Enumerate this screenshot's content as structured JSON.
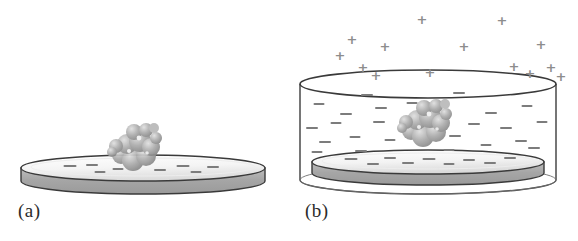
{
  "figure": {
    "width": 578,
    "height": 241,
    "background": "#ffffff"
  },
  "colors": {
    "outline": "#3a3a3a",
    "disk_side": "#a8a8a8",
    "disk_side_dark": "#8f8f8f",
    "disk_top": "#f2f2f2",
    "disk_top_shade": "#d8d8d8",
    "molecule": "#a3a3a3",
    "molecule_dark": "#8a8a8a",
    "molecule_light": "#d5d5d5",
    "ion_positive": "#8d8d8d",
    "ion_negative": "#7c7c7c",
    "label_text": "#2b2b2b",
    "beaker_glass": "#4a4a4a"
  },
  "panels": [
    {
      "id": "a",
      "label": "(a)",
      "caption_text": "(a)",
      "description": "Charged disk substrate in air with a single molecule adsorbed on its upper surface",
      "has_beaker": false,
      "has_positive_ions": false,
      "disk": {
        "center_x": 143,
        "top_center_y": 168,
        "radius_x": 122,
        "radius_y": 13,
        "thickness": 26
      },
      "molecule": {
        "center_x": 133,
        "center_y": 148,
        "scale": 1.0
      },
      "surface_charges": [
        {
          "x": 70,
          "y": 166,
          "w": 13
        },
        {
          "x": 92,
          "y": 165,
          "w": 12
        },
        {
          "x": 100,
          "y": 172,
          "w": 11
        },
        {
          "x": 118,
          "y": 169,
          "w": 11
        },
        {
          "x": 160,
          "y": 170,
          "w": 12
        },
        {
          "x": 183,
          "y": 166,
          "w": 13
        },
        {
          "x": 196,
          "y": 172,
          "w": 11
        },
        {
          "x": 213,
          "y": 167,
          "w": 12
        }
      ]
    },
    {
      "id": "b",
      "label": "(b)",
      "caption_text": "(b)",
      "description": "Same substrate immersed in an electrolyte-filled beaker; positive counter-ions above, negative charges dispersed in the solution",
      "has_beaker": true,
      "has_positive_ions": true,
      "beaker": {
        "center_x": 139,
        "rim_y": 84,
        "radius_x": 128,
        "radius_y": 14,
        "height": 96
      },
      "disk": {
        "center_x": 139,
        "top_center_y": 162,
        "radius_x": 116,
        "radius_y": 12,
        "thickness": 22
      },
      "molecule": {
        "center_x": 134,
        "center_y": 124,
        "scale": 1.05
      },
      "positive_ions": [
        {
          "x": 51,
          "y": 55
        },
        {
          "x": 63,
          "y": 39
        },
        {
          "x": 74,
          "y": 67
        },
        {
          "x": 87,
          "y": 75
        },
        {
          "x": 96,
          "y": 46
        },
        {
          "x": 133,
          "y": 19
        },
        {
          "x": 141,
          "y": 72
        },
        {
          "x": 175,
          "y": 46
        },
        {
          "x": 213,
          "y": 20
        },
        {
          "x": 225,
          "y": 66
        },
        {
          "x": 241,
          "y": 73
        },
        {
          "x": 252,
          "y": 44
        },
        {
          "x": 262,
          "y": 67
        },
        {
          "x": 272,
          "y": 76
        }
      ],
      "negative_ions": [
        {
          "x": 78,
          "y": 95,
          "w": 12
        },
        {
          "x": 170,
          "y": 93,
          "w": 12
        },
        {
          "x": 30,
          "y": 104,
          "w": 11
        },
        {
          "x": 57,
          "y": 114,
          "w": 12
        },
        {
          "x": 92,
          "y": 108,
          "w": 12
        },
        {
          "x": 123,
          "y": 103,
          "w": 11
        },
        {
          "x": 202,
          "y": 113,
          "w": 12
        },
        {
          "x": 238,
          "y": 106,
          "w": 11
        },
        {
          "x": 23,
          "y": 128,
          "w": 12
        },
        {
          "x": 47,
          "y": 123,
          "w": 11
        },
        {
          "x": 90,
          "y": 122,
          "w": 12
        },
        {
          "x": 185,
          "y": 124,
          "w": 12
        },
        {
          "x": 217,
          "y": 128,
          "w": 12
        },
        {
          "x": 253,
          "y": 122,
          "w": 11
        },
        {
          "x": 36,
          "y": 142,
          "w": 12
        },
        {
          "x": 66,
          "y": 137,
          "w": 11
        },
        {
          "x": 101,
          "y": 140,
          "w": 11
        },
        {
          "x": 166,
          "y": 136,
          "w": 12
        },
        {
          "x": 197,
          "y": 145,
          "w": 11
        },
        {
          "x": 232,
          "y": 141,
          "w": 12
        },
        {
          "x": 28,
          "y": 152,
          "w": 11
        },
        {
          "x": 72,
          "y": 151,
          "w": 12
        },
        {
          "x": 160,
          "y": 150,
          "w": 11
        },
        {
          "x": 245,
          "y": 148,
          "w": 12
        }
      ],
      "surface_charges": [
        {
          "x": 62,
          "y": 159,
          "w": 13
        },
        {
          "x": 84,
          "y": 164,
          "w": 12
        },
        {
          "x": 101,
          "y": 158,
          "w": 12
        },
        {
          "x": 119,
          "y": 163,
          "w": 12
        },
        {
          "x": 140,
          "y": 159,
          "w": 13
        },
        {
          "x": 160,
          "y": 164,
          "w": 11
        },
        {
          "x": 180,
          "y": 160,
          "w": 12
        },
        {
          "x": 201,
          "y": 163,
          "w": 12
        },
        {
          "x": 221,
          "y": 158,
          "w": 12
        }
      ]
    }
  ]
}
